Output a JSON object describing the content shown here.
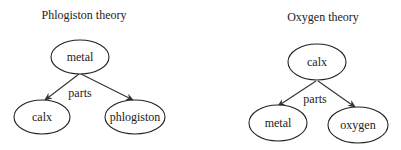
{
  "diagrams": [
    {
      "title": "Phlogiston theory",
      "root": "metal",
      "edge_label": "parts",
      "children": [
        "calx",
        "phlogiston"
      ]
    },
    {
      "title": "Oxygen theory",
      "root": "calx",
      "edge_label": "parts",
      "children": [
        "metal",
        "oxygen"
      ]
    }
  ]
}
